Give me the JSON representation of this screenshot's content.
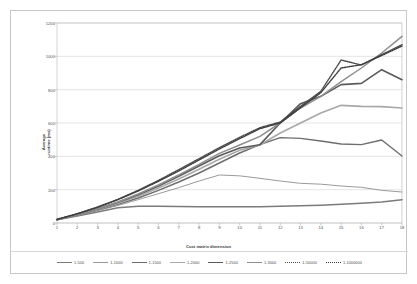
{
  "chart_data": {
    "type": "line",
    "title": "",
    "xlabel": "Cost matrix dimension",
    "ylabel": "Average runtime (ms)",
    "ylabel_line1": "Average",
    "ylabel_line2": "runtime (ms)",
    "x": [
      1,
      2,
      3,
      4,
      5,
      6,
      7,
      8,
      9,
      10,
      11,
      12,
      13,
      14,
      15,
      16,
      17,
      18
    ],
    "xlim": [
      1,
      18
    ],
    "ylim": [
      0,
      1200
    ],
    "yticks": [
      0,
      200,
      400,
      600,
      800,
      1000,
      1200
    ],
    "xticks": [
      1,
      2,
      3,
      4,
      5,
      6,
      7,
      8,
      9,
      10,
      11,
      12,
      13,
      14,
      15,
      16,
      17,
      18
    ],
    "grid": "horizontal",
    "legend_position": "bottom",
    "series": [
      {
        "name": "1-500",
        "style": "solid",
        "color": "#7b7b7b",
        "width": 1.5,
        "values": [
          20,
          42,
          66,
          92,
          100,
          100,
          99,
          98,
          97,
          97,
          98,
          100,
          103,
          107,
          112,
          118,
          126,
          140
        ]
      },
      {
        "name": "1-1000",
        "style": "solid",
        "color": "#9a9a9a",
        "width": 1.0,
        "values": [
          20,
          45,
          74,
          105,
          140,
          176,
          212,
          252,
          288,
          283,
          268,
          252,
          238,
          233,
          222,
          214,
          196,
          186
        ]
      },
      {
        "name": "1-1500",
        "style": "solid",
        "color": "#6d6d6d",
        "width": 1.4,
        "values": [
          20,
          47,
          78,
          112,
          150,
          196,
          246,
          300,
          360,
          420,
          470,
          512,
          508,
          492,
          474,
          470,
          498,
          402
        ]
      },
      {
        "name": "1-2000",
        "style": "solid",
        "color": "#a8a8a8",
        "width": 1.6,
        "values": [
          20,
          48,
          80,
          118,
          160,
          210,
          264,
          322,
          382,
          436,
          468,
          540,
          600,
          660,
          706,
          700,
          698,
          690
        ]
      },
      {
        "name": "1-2500",
        "style": "solid",
        "color": "#5a5a5a",
        "width": 1.6,
        "values": [
          20,
          50,
          84,
          124,
          170,
          222,
          280,
          342,
          404,
          450,
          470,
          600,
          716,
          760,
          830,
          838,
          920,
          860
        ]
      },
      {
        "name": "1-3000",
        "style": "solid",
        "color": "#8e8e8e",
        "width": 1.5,
        "values": [
          20,
          50,
          86,
          126,
          174,
          228,
          288,
          352,
          418,
          468,
          520,
          600,
          690,
          760,
          848,
          930,
          1020,
          1120
        ]
      },
      {
        "name": "1-50000",
        "style": "dotted",
        "color": "#4a4a4a",
        "width": 1.4,
        "values": [
          22,
          56,
          96,
          142,
          196,
          256,
          320,
          386,
          452,
          514,
          572,
          606,
          700,
          790,
          978,
          948,
          1010,
          1070
        ]
      },
      {
        "name": "1-1000000",
        "style": "dotted",
        "color": "#3d3d3d",
        "width": 1.4,
        "values": [
          22,
          55,
          94,
          140,
          192,
          250,
          312,
          378,
          444,
          506,
          566,
          600,
          692,
          782,
          930,
          950,
          1005,
          1062
        ]
      }
    ]
  }
}
